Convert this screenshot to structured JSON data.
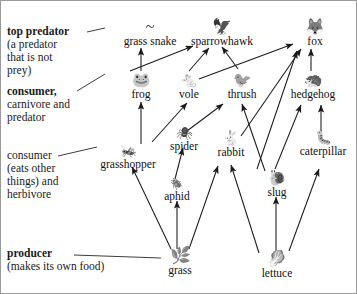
{
  "diagram": {
    "type": "food-web",
    "background": "#ffffff",
    "border_color": "#9a9a9a",
    "line_color": "#1a1a1a"
  },
  "key_labels": [
    {
      "id": "top-predator",
      "bold": "top predator",
      "detail": "(a predator that is not prey)",
      "points_to": "grass-snake"
    },
    {
      "id": "consumer-carnivore",
      "bold": "consumer",
      "detail": "carnivore and predator",
      "points_to": "frog"
    },
    {
      "id": "consumer-herbivore",
      "bold": "consumer",
      "detail": "(eats other things) and herbivore",
      "points_to": "grasshopper"
    },
    {
      "id": "producer",
      "bold": "producer",
      "detail": "(makes its own food)",
      "points_to": "grass"
    }
  ],
  "key_text": {
    "top_predator_bold": "top predator",
    "top_predator_l1": "(a predator",
    "top_predator_l2": "that is not",
    "top_predator_l3": "prey)",
    "consumer_carn_bold": "consumer,",
    "consumer_carn_l1": "carnivore and",
    "consumer_carn_l2": "predator",
    "consumer_herb_bold": "consumer",
    "consumer_herb_l1": "(eats other",
    "consumer_herb_l2": "things) and",
    "consumer_herb_l3": "herbivore",
    "producer_bold": "producer",
    "producer_l1": "(makes its own food)"
  },
  "organisms": [
    {
      "id": "grass-snake",
      "label": "grass snake",
      "icon": "snake-icon",
      "glyph": "~",
      "trophic": "top predator",
      "x": 117,
      "y": 18,
      "w": 64
    },
    {
      "id": "sparrowhawk",
      "label": "sparrowhawk",
      "icon": "hawk-icon",
      "glyph": "🦅",
      "trophic": "top predator",
      "x": 186,
      "y": 18,
      "w": 70
    },
    {
      "id": "fox",
      "label": "fox",
      "icon": "fox-icon",
      "glyph": "🦊",
      "trophic": "top predator",
      "x": 296,
      "y": 18,
      "w": 44
    },
    {
      "id": "frog",
      "label": "frog",
      "icon": "frog-icon",
      "glyph": "🐸",
      "trophic": "consumer",
      "x": 100,
      "y": 72,
      "w": 46
    },
    {
      "id": "vole",
      "label": "vole",
      "icon": "vole-icon",
      "glyph": "🐁",
      "trophic": "consumer",
      "x": 175,
      "y": 72,
      "w": 44
    },
    {
      "id": "thrush",
      "label": "thrush",
      "icon": "thrush-icon",
      "glyph": "🐦",
      "trophic": "consumer",
      "x": 226,
      "y": 72,
      "w": 52
    },
    {
      "id": "hedgehog",
      "label": "hedgehog",
      "icon": "hedgehog-icon",
      "glyph": "🦔",
      "trophic": "consumer",
      "x": 288,
      "y": 72,
      "w": 62
    },
    {
      "id": "grasshopper",
      "label": "grasshopper",
      "icon": "grasshopper-icon",
      "glyph": "🦗",
      "trophic": "herbivore",
      "x": 88,
      "y": 143,
      "w": 76
    },
    {
      "id": "spider",
      "label": "spider",
      "icon": "spider-icon",
      "glyph": "🕷",
      "trophic": "consumer",
      "x": 160,
      "y": 126,
      "w": 46
    },
    {
      "id": "rabbit",
      "label": "rabbit",
      "icon": "rabbit-icon",
      "glyph": "🐇",
      "trophic": "herbivore",
      "x": 212,
      "y": 135,
      "w": 46
    },
    {
      "id": "caterpillar",
      "label": "caterpillar",
      "icon": "caterpillar-icon",
      "glyph": "🐛",
      "trophic": "herbivore",
      "x": 297,
      "y": 135,
      "w": 64
    },
    {
      "id": "aphid",
      "label": "aphid",
      "icon": "aphid-icon",
      "glyph": "🪲",
      "trophic": "herbivore",
      "x": 160,
      "y": 178,
      "w": 44
    },
    {
      "id": "slug",
      "label": "slug",
      "icon": "slug-icon",
      "glyph": "🐌",
      "trophic": "herbivore",
      "x": 256,
      "y": 170,
      "w": 40
    },
    {
      "id": "grass",
      "label": "grass",
      "icon": "grass-icon",
      "glyph": "🌿",
      "trophic": "producer",
      "x": 168,
      "y": 248,
      "w": 44
    },
    {
      "id": "lettuce",
      "label": "lettuce",
      "icon": "lettuce-icon",
      "glyph": "🥬",
      "trophic": "producer",
      "x": 258,
      "y": 252,
      "w": 50
    }
  ],
  "feeding_arrows": [
    {
      "from": "frog",
      "to": "grass-snake"
    },
    {
      "from": "frog",
      "to": "sparrowhawk"
    },
    {
      "from": "vole",
      "to": "sparrowhawk"
    },
    {
      "from": "vole",
      "to": "fox"
    },
    {
      "from": "thrush",
      "to": "sparrowhawk"
    },
    {
      "from": "rabbit",
      "to": "fox"
    },
    {
      "from": "hedgehog",
      "to": "fox"
    },
    {
      "from": "slug",
      "to": "fox"
    },
    {
      "from": "slug",
      "to": "thrush"
    },
    {
      "from": "slug",
      "to": "hedgehog"
    },
    {
      "from": "caterpillar",
      "to": "hedgehog"
    },
    {
      "from": "spider",
      "to": "thrush"
    },
    {
      "from": "aphid",
      "to": "spider"
    },
    {
      "from": "grasshopper",
      "to": "frog"
    },
    {
      "from": "grasshopper",
      "to": "vole"
    },
    {
      "from": "grass",
      "to": "grasshopper"
    },
    {
      "from": "grass",
      "to": "aphid"
    },
    {
      "from": "grass",
      "to": "rabbit"
    },
    {
      "from": "lettuce",
      "to": "rabbit"
    },
    {
      "from": "lettuce",
      "to": "slug"
    },
    {
      "from": "lettuce",
      "to": "caterpillar"
    }
  ]
}
